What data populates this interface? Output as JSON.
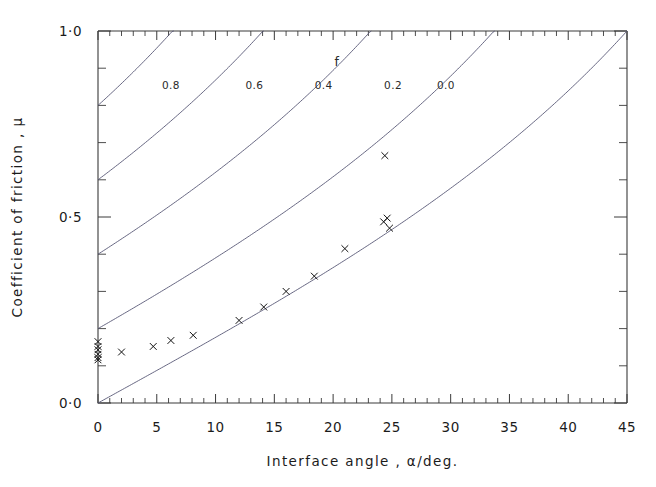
{
  "chart_data": {
    "type": "line",
    "title": "",
    "xlabel": "Interface angle , α/deg.",
    "ylabel": "Coefficient of friction , μ",
    "xlim": [
      0,
      45
    ],
    "ylim": [
      0.0,
      1.0
    ],
    "grid": false,
    "legend_position": "inline-curve-labels",
    "legend_title": "f",
    "x_ticks_major": [
      0,
      5,
      10,
      15,
      20,
      25,
      30,
      35,
      40,
      45
    ],
    "x_tick_labels": [
      "0",
      "5",
      "10",
      "15",
      "20",
      "25",
      "30",
      "35",
      "40",
      "45"
    ],
    "x_minor_step": 1,
    "y_ticks_major": [
      0.0,
      0.5,
      1.0
    ],
    "y_tick_labels": [
      "0·0",
      "0·5",
      "1·0"
    ],
    "y_minor_step": 0.1,
    "curve_formula": "mu = (f + tan(alpha)) / (1 - f*tan(alpha))",
    "series": [
      {
        "name": "0.8",
        "f": 0.8,
        "label": "0.8",
        "label_x": 6.2,
        "label_y": 0.845
      },
      {
        "name": "0.6",
        "f": 0.6,
        "label": "0.6",
        "label_x": 13.3,
        "label_y": 0.845
      },
      {
        "name": "0.4",
        "f": 0.4,
        "label": "0.4",
        "label_x": 19.2,
        "label_y": 0.845
      },
      {
        "name": "0.2",
        "f": 0.2,
        "label": "0.2",
        "label_x": 25.1,
        "label_y": 0.845
      },
      {
        "name": "0.0",
        "f": 0.0,
        "label": "0.0",
        "label_x": 29.6,
        "label_y": 0.845
      }
    ],
    "legend_title_x": 20.3,
    "legend_title_y": 0.905,
    "scatter": {
      "name": "experimental data",
      "marker": "x",
      "points": [
        {
          "x": 0.0,
          "y": 0.165
        },
        {
          "x": 0.0,
          "y": 0.152
        },
        {
          "x": 0.0,
          "y": 0.143
        },
        {
          "x": 0.0,
          "y": 0.131
        },
        {
          "x": 0.0,
          "y": 0.122
        },
        {
          "x": 0.0,
          "y": 0.116
        },
        {
          "x": 2.0,
          "y": 0.137
        },
        {
          "x": 4.7,
          "y": 0.152
        },
        {
          "x": 6.2,
          "y": 0.168
        },
        {
          "x": 8.1,
          "y": 0.182
        },
        {
          "x": 12.0,
          "y": 0.222
        },
        {
          "x": 14.1,
          "y": 0.258
        },
        {
          "x": 16.0,
          "y": 0.3
        },
        {
          "x": 18.4,
          "y": 0.341
        },
        {
          "x": 21.0,
          "y": 0.415
        },
        {
          "x": 24.3,
          "y": 0.487
        },
        {
          "x": 24.6,
          "y": 0.497
        },
        {
          "x": 24.8,
          "y": 0.47
        },
        {
          "x": 24.4,
          "y": 0.665
        }
      ]
    }
  }
}
